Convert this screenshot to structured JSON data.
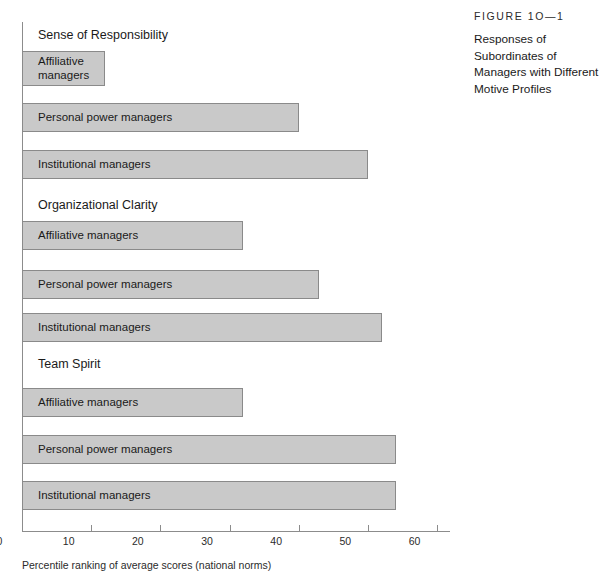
{
  "caption": {
    "figure_number": "FIGURE 1O—1",
    "title": "Responses of Subordinates of Managers with Different Motive Profiles"
  },
  "axis": {
    "x_title": "Percentile ranking of average scores (national norms)",
    "ticks": [
      "0",
      "10",
      "20",
      "30",
      "40",
      "50",
      "60"
    ]
  },
  "chart_data": {
    "type": "bar",
    "orientation": "horizontal",
    "title": "Responses of Subordinates of Managers with Different Motive Profiles",
    "xlabel": "Percentile ranking of average scores (national norms)",
    "ylabel": "",
    "xlim": [
      0,
      60
    ],
    "xticks": [
      0,
      10,
      20,
      30,
      40,
      50,
      60
    ],
    "grid": false,
    "legend": "none",
    "bar_color": "#c9c9c9",
    "bar_border_color": "#8a8a8a",
    "groups": [
      {
        "name": "Sense of Responsibility",
        "bars": [
          {
            "label": "Affiliative\nmanagers",
            "value": 12
          },
          {
            "label": "Personal power managers",
            "value": 40
          },
          {
            "label": "Institutional managers",
            "value": 50
          }
        ]
      },
      {
        "name": "Organizational Clarity",
        "bars": [
          {
            "label": "Affiliative managers",
            "value": 32
          },
          {
            "label": "Personal power managers",
            "value": 43
          },
          {
            "label": "Institutional managers",
            "value": 52
          }
        ]
      },
      {
        "name": "Team Spirit",
        "bars": [
          {
            "label": "Affiliative managers",
            "value": 32
          },
          {
            "label": "Personal power managers",
            "value": 54
          },
          {
            "label": "Institutional managers",
            "value": 54
          }
        ]
      }
    ],
    "categories": [
      "Sense of Responsibility — Affiliative managers",
      "Sense of Responsibility — Personal power managers",
      "Sense of Responsibility — Institutional managers",
      "Organizational Clarity — Affiliative managers",
      "Organizational Clarity — Personal power managers",
      "Organizational Clarity — Institutional managers",
      "Team Spirit — Affiliative managers",
      "Team Spirit — Personal power managers",
      "Team Spirit — Institutional managers"
    ],
    "values": [
      12,
      40,
      50,
      32,
      43,
      52,
      32,
      54,
      54
    ]
  },
  "layout": {
    "group_heading_tops": [
      28,
      198,
      357
    ],
    "bars": [
      {
        "top": 51,
        "height": 35
      },
      {
        "top": 103,
        "height": 29
      },
      {
        "top": 150,
        "height": 29
      },
      {
        "top": 221,
        "height": 29
      },
      {
        "top": 270,
        "height": 29
      },
      {
        "top": 313,
        "height": 29
      },
      {
        "top": 388,
        "height": 29
      },
      {
        "top": 435,
        "height": 29
      },
      {
        "top": 481,
        "height": 29
      }
    ]
  }
}
